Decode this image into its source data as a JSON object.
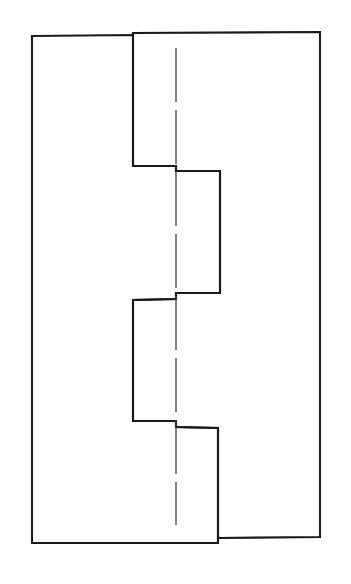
{
  "document": {
    "kind": "technical-line-drawing",
    "subject": "Stepped interlocking joint profile (front view)",
    "background_color": "#ffffff",
    "width": 351,
    "height": 584
  },
  "drawing": {
    "title": "",
    "outline": {
      "name": "joint-profile-outline",
      "stroke_color": "#1a1a1a",
      "fill_color": "#ffffff",
      "stroke_width": 2.1,
      "closed": true,
      "points": [
        [
          32,
          36
        ],
        [
          133,
          35
        ],
        [
          133,
          33
        ],
        [
          320,
          32
        ],
        [
          320,
          537
        ],
        [
          218,
          538
        ],
        [
          218,
          543
        ],
        [
          32,
          543
        ]
      ],
      "step_points": [
        [
          133,
          35
        ],
        [
          133,
          166
        ],
        [
          176,
          166
        ],
        [
          176,
          171
        ],
        [
          220,
          171
        ],
        [
          220,
          293
        ],
        [
          176,
          293
        ],
        [
          176,
          299
        ],
        [
          133,
          300
        ],
        [
          133,
          421
        ],
        [
          176,
          421
        ],
        [
          176,
          427
        ],
        [
          218,
          428
        ]
      ]
    },
    "center_line": {
      "name": "vertical-centerline",
      "style": "dash-dot",
      "stroke_color": "#3a3a3a",
      "stroke_width": 1.25,
      "x": 176,
      "y_start": 48,
      "y_end": 525,
      "dash_pattern": "54 8"
    }
  },
  "geometry": {
    "outer_left_x": 32,
    "outer_right_x": 320,
    "outer_top_y": 32,
    "outer_bottom_y": 543,
    "step_left_x": 133,
    "step_right_x": 220,
    "jog_x": 176,
    "step1_y": 166,
    "step1_y_offset": 171,
    "step2_y": 293,
    "step2_y_offset": 300,
    "step3_y": 421,
    "step3_y_offset": 427
  }
}
